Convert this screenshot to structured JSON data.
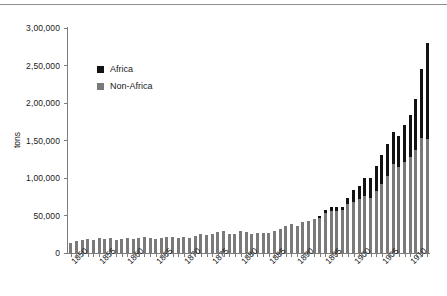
{
  "chart_data": {
    "type": "bar",
    "stacked": true,
    "title": "",
    "subtitle": "",
    "xlabel": "",
    "ylabel": "tons",
    "ylim": [
      0,
      300000
    ],
    "ytick_values": [
      0,
      50000,
      100000,
      150000,
      200000,
      250000,
      300000
    ],
    "ytick_labels": [
      "0",
      "50,000",
      "1,00,000",
      "1,50,000",
      "2,00,000",
      "2,50,000",
      "3,00,000"
    ],
    "grid": false,
    "legend_position": "inside-upper-left",
    "x": [
      1850,
      1851,
      1852,
      1853,
      1854,
      1855,
      1856,
      1857,
      1858,
      1859,
      1860,
      1861,
      1862,
      1863,
      1864,
      1865,
      1866,
      1867,
      1868,
      1869,
      1870,
      1871,
      1872,
      1873,
      1874,
      1875,
      1876,
      1877,
      1878,
      1879,
      1880,
      1881,
      1882,
      1883,
      1884,
      1885,
      1886,
      1887,
      1888,
      1889,
      1890,
      1891,
      1892,
      1893,
      1894,
      1895,
      1896,
      1897,
      1898,
      1899,
      1900,
      1901,
      1902,
      1903,
      1904,
      1905,
      1906,
      1907,
      1908,
      1909,
      1910,
      1911,
      1912,
      1913
    ],
    "xtick_labels": [
      "1850",
      "1855",
      "1860",
      "1865",
      "1870",
      "1875",
      "1880",
      "1885",
      "1890",
      "1895",
      "1900",
      "1905",
      "1910"
    ],
    "xtick_years": [
      1850,
      1855,
      1860,
      1865,
      1870,
      1875,
      1880,
      1885,
      1890,
      1895,
      1900,
      1905,
      1910
    ],
    "series": [
      {
        "name": "Non-Africa",
        "color": "#7a7a7a",
        "values": [
          14000,
          16000,
          17000,
          19000,
          18000,
          20000,
          19000,
          20000,
          18000,
          19000,
          20000,
          19000,
          20000,
          21000,
          20000,
          19000,
          20000,
          21000,
          22000,
          20000,
          21000,
          20000,
          23000,
          25000,
          24000,
          25000,
          28000,
          30000,
          26000,
          25000,
          29000,
          28000,
          26000,
          27000,
          27000,
          27000,
          29000,
          32000,
          36000,
          39000,
          36000,
          41000,
          43000,
          46000,
          47000,
          53000,
          56000,
          56000,
          57000,
          65000,
          68000,
          72000,
          76000,
          74000,
          83000,
          92000,
          103000,
          119000,
          115000,
          122000,
          128000,
          137000,
          153000,
          152000
        ]
      },
      {
        "name": "Africa",
        "color": "#131313",
        "values": [
          0,
          0,
          0,
          0,
          0,
          0,
          0,
          0,
          0,
          0,
          0,
          0,
          0,
          0,
          0,
          0,
          0,
          0,
          0,
          0,
          0,
          0,
          0,
          0,
          0,
          0,
          0,
          0,
          0,
          0,
          0,
          0,
          0,
          0,
          0,
          0,
          0,
          0,
          0,
          0,
          0,
          0,
          0,
          0,
          2000,
          4000,
          5000,
          5000,
          5000,
          8000,
          16000,
          18000,
          24000,
          26000,
          33000,
          39000,
          43000,
          42000,
          41000,
          49000,
          56000,
          68000,
          93000,
          128000
        ]
      }
    ],
    "legend": [
      {
        "label": "Africa",
        "color": "#131313"
      },
      {
        "label": "Non-Africa",
        "color": "#7a7a7a"
      }
    ]
  }
}
